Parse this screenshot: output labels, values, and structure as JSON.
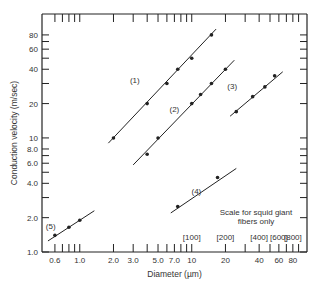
{
  "chart_data": {
    "type": "scatter",
    "title": "",
    "xlabel": "Diameter (µm)",
    "ylabel": "Conduction velocity (m/sec)",
    "xscale": "log",
    "yscale": "log",
    "xlim": [
      0.46,
      107
    ],
    "ylim": [
      1.0,
      122
    ],
    "grid": false,
    "x_tick_labels": [
      "0.6",
      "1.0",
      "2.0",
      "3.0",
      "5.0",
      "7.0",
      "10",
      "20",
      "40",
      "60",
      "80"
    ],
    "x_tick_values": [
      0.6,
      1.0,
      2.0,
      3.0,
      5.0,
      7.0,
      10,
      20,
      40,
      60,
      80
    ],
    "x_minor_ticks": [
      0.7,
      0.8,
      0.9,
      4,
      6,
      8,
      9,
      30,
      50,
      70,
      90
    ],
    "y_tick_labels": [
      "1.0",
      "2.0",
      "4.0",
      "6.0",
      "8.0",
      "10",
      "20",
      "40",
      "60",
      "80"
    ],
    "y_tick_values": [
      1.0,
      2.0,
      4.0,
      6.0,
      8.0,
      10,
      20,
      40,
      60,
      80
    ],
    "y_minor_ticks": [
      3,
      5,
      7,
      30,
      50,
      70
    ],
    "secondary_x_scale": {
      "caption": [
        "Scale for squid giant",
        "fibers only"
      ],
      "labels": [
        "[100]",
        "[200]",
        "[400]",
        "[600]",
        "[800]"
      ],
      "positions": [
        10,
        20,
        40,
        60,
        80
      ]
    },
    "series": [
      {
        "name": "(1)",
        "points": [
          [
            2.0,
            10
          ],
          [
            4.0,
            20
          ],
          [
            6.0,
            30
          ],
          [
            7.5,
            40
          ],
          [
            10,
            50
          ],
          [
            15,
            80
          ]
        ],
        "fit": [
          [
            1.8,
            9
          ],
          [
            16.5,
            90
          ]
        ]
      },
      {
        "name": "(2)",
        "points": [
          [
            4.0,
            7.2
          ],
          [
            5.0,
            10
          ],
          [
            10,
            20
          ],
          [
            12,
            24
          ],
          [
            15,
            30
          ],
          [
            20,
            40
          ]
        ],
        "fit": [
          [
            3.0,
            5.8
          ],
          [
            24,
            48
          ]
        ]
      },
      {
        "name": "(3)",
        "points": [
          [
            25,
            17
          ],
          [
            35,
            23
          ],
          [
            45,
            28
          ],
          [
            55,
            35
          ]
        ],
        "fit": [
          [
            22,
            15.5
          ],
          [
            65,
            38
          ]
        ]
      },
      {
        "name": "(4)",
        "points": [
          [
            7.5,
            2.5
          ],
          [
            17,
            4.5
          ]
        ],
        "fit": [
          [
            6.5,
            2.2
          ],
          [
            25,
            5.4
          ]
        ]
      },
      {
        "name": "(5)",
        "points": [
          [
            0.6,
            1.4
          ],
          [
            0.8,
            1.65
          ],
          [
            1.0,
            1.9
          ]
        ],
        "fit": [
          [
            0.52,
            1.25
          ],
          [
            1.35,
            2.3
          ]
        ]
      }
    ],
    "annotations": [
      {
        "text": "(1)",
        "x": 3.1,
        "y": 30
      },
      {
        "text": "(2)",
        "x": 7.0,
        "y": 17
      },
      {
        "text": "(3)",
        "x": 23,
        "y": 27
      },
      {
        "text": "(4)",
        "x": 11,
        "y": 3.2
      },
      {
        "text": "(5)",
        "x": 0.55,
        "y": 1.6
      }
    ]
  }
}
